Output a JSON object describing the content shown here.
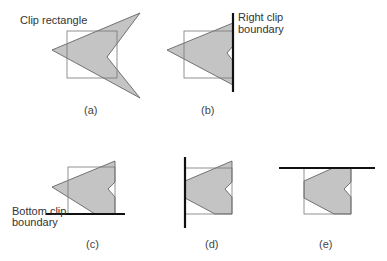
{
  "figure": {
    "colors": {
      "fill": "#c4c4c4",
      "stroke": "#555555",
      "boundary": "#111111",
      "rect": "#777777"
    },
    "labels": {
      "clip_rectangle": "Clip rectangle",
      "right_clip_boundary_1": "Right clip",
      "right_clip_boundary_2": "boundary",
      "bottom_clip_boundary_1": "Bottom clip",
      "bottom_clip_boundary_2": "boundary"
    },
    "panels": [
      {
        "id": "a",
        "caption": "(a)",
        "description": "Original polygon and clip rectangle"
      },
      {
        "id": "b",
        "caption": "(b)",
        "description": "Clipped against right boundary"
      },
      {
        "id": "c",
        "caption": "(c)",
        "description": "Clipped against bottom boundary"
      },
      {
        "id": "d",
        "caption": "(d)",
        "description": "Clipped against left boundary"
      },
      {
        "id": "e",
        "caption": "(e)",
        "description": "Clipped against top boundary"
      }
    ]
  }
}
